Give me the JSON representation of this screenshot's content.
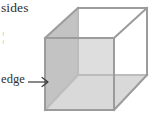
{
  "figure": {
    "kind": "geometry-illustration",
    "background_color": "#ffffff"
  },
  "labels": {
    "sides": "sides",
    "stray_text": "¦",
    "edge": "edge",
    "arrow_glyph": "arrow-right"
  },
  "colors": {
    "outline": "#9a9a9a",
    "outline_back": "#bdbdbd",
    "face_left": "#c2c2c2",
    "face_bottom": "#d6d6d6",
    "face_back": "#dcdcdc",
    "face_front": "#ffffff",
    "text": "#2e2e2e",
    "arrow": "#3a3a3a"
  },
  "geometry": {
    "shape": "cube",
    "projection": "oblique-cabinet",
    "front_face": {
      "top_left": [
        45,
        38
      ],
      "top_right": [
        114,
        38
      ],
      "bottom_right": [
        114,
        110
      ],
      "bottom_left": [
        45,
        110
      ]
    },
    "back_face": {
      "top_left": [
        78,
        8
      ],
      "top_right": [
        147,
        8
      ],
      "bottom_right": [
        147,
        75
      ],
      "bottom_left": [
        78,
        75
      ]
    },
    "depth_offset": [
      33,
      -30
    ],
    "highlighted_edge": {
      "name": "front-left-vertical-edge",
      "from": [
        45,
        38
      ],
      "to": [
        45,
        110
      ]
    },
    "shaded_faces": [
      "left",
      "bottom",
      "back"
    ]
  }
}
